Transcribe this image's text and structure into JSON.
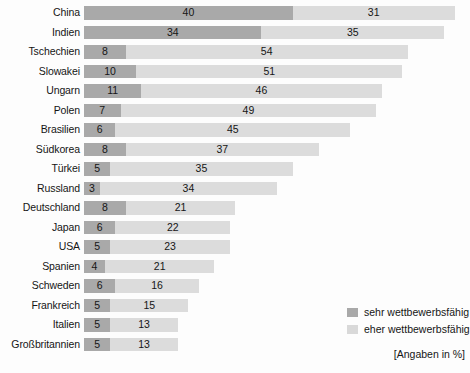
{
  "chart_data": {
    "type": "bar",
    "orientation": "horizontal",
    "stacked": true,
    "title": "",
    "subtitle": "",
    "xlabel": "",
    "ylabel": "",
    "units_note": "[Angaben in %]",
    "xlim": [
      0,
      71
    ],
    "grid": false,
    "legend_position": "bottom-right",
    "categories": [
      "China",
      "Indien",
      "Tschechien",
      "Slowakei",
      "Ungarn",
      "Polen",
      "Brasilien",
      "Südkorea",
      "Türkei",
      "Russland",
      "Deutschland",
      "Japan",
      "USA",
      "Spanien",
      "Schweden",
      "Frankreich",
      "Italien",
      "Großbritannien"
    ],
    "series": [
      {
        "name": "sehr wettbewerbsfähig",
        "color": "#a9a9a9",
        "values": [
          40,
          34,
          8,
          10,
          11,
          7,
          6,
          8,
          5,
          3,
          8,
          6,
          5,
          4,
          6,
          5,
          5,
          5
        ]
      },
      {
        "name": "eher wettbewerbsfähig",
        "color": "#dcdcdc",
        "values": [
          31,
          35,
          54,
          51,
          46,
          49,
          45,
          37,
          35,
          34,
          21,
          22,
          23,
          21,
          16,
          15,
          13,
          13
        ]
      }
    ],
    "totals": [
      71,
      69,
      62,
      61,
      57,
      56,
      51,
      45,
      40,
      37,
      29,
      28,
      28,
      25,
      22,
      20,
      18,
      18
    ]
  },
  "legend": {
    "items": [
      {
        "label": "sehr wettbewerbsfähig",
        "swatch": "strong"
      },
      {
        "label": "eher wettbewerbsfähig",
        "swatch": "weak"
      }
    ]
  }
}
